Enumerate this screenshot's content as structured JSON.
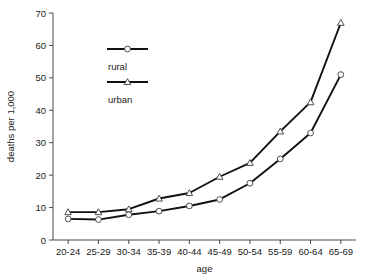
{
  "chart_data": {
    "type": "line",
    "title": "",
    "xlabel": "age",
    "ylabel": "deaths per 1,000",
    "categories": [
      "20-24",
      "25-29",
      "30-34",
      "35-39",
      "40-44",
      "45-49",
      "50-54",
      "55-59",
      "60-64",
      "65-69"
    ],
    "series": [
      {
        "name": "rural",
        "marker": "circle",
        "values": [
          6.5,
          6.3,
          7.8,
          8.9,
          10.5,
          12.5,
          17.5,
          25.0,
          33.0,
          51.0
        ]
      },
      {
        "name": "urban",
        "marker": "triangle",
        "values": [
          8.6,
          8.6,
          9.5,
          12.8,
          14.5,
          19.5,
          23.8,
          33.5,
          42.5,
          67.0
        ]
      }
    ],
    "ylim": [
      0,
      70
    ],
    "yticks": [
      0,
      10,
      20,
      30,
      40,
      50,
      60,
      70
    ],
    "ytick_labels": [
      "0",
      "10",
      "20",
      "30",
      "40",
      "50",
      "60",
      "70"
    ],
    "grid": false,
    "legend_position": "upper-left-inside",
    "line_color": "#111111",
    "axis_color": "#4a4a4a",
    "background": "#ffffff"
  },
  "legend": {
    "entries": [
      {
        "label": "rural",
        "marker": "circle"
      },
      {
        "label": "urban",
        "marker": "triangle"
      }
    ]
  }
}
